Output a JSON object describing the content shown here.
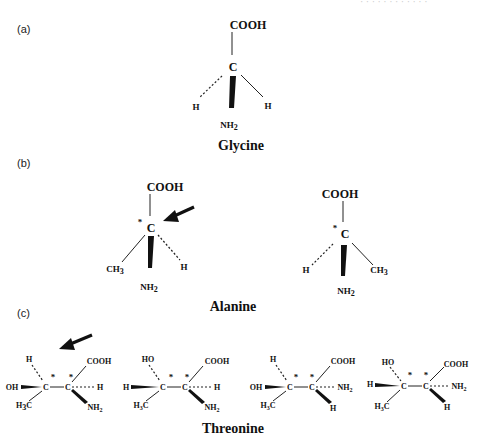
{
  "header_fragment": "· · · · · · · · · · · ·",
  "panels": {
    "a": {
      "label": "(a)",
      "name": "Glycine",
      "top": "COOH",
      "center": "C",
      "left": "H",
      "right": "H",
      "bottom": "NH",
      "bottom_sub": "2"
    },
    "b": {
      "label": "(b)",
      "name": "Alanine",
      "left_isomer": {
        "top": "COOH",
        "center": "C",
        "star": "*",
        "left": "CH",
        "left_sub": "3",
        "right": "H",
        "bottom": "NH",
        "bottom_sub": "2"
      },
      "right_isomer": {
        "top": "COOH",
        "center": "C",
        "star": "*",
        "left": "H",
        "right": "CH",
        "right_sub": "3",
        "bottom": "NH",
        "bottom_sub": "2"
      }
    },
    "c": {
      "label": "(c)",
      "name": "Threonine",
      "isomers": [
        {
          "c1_up": "H",
          "c1_wedge": "OH",
          "c1_down": "H",
          "c1_down_sub": "3",
          "c1_down_tail": "C",
          "c2_up": "COOH",
          "c2_dash": "H",
          "c2_wedge": "NH",
          "c2_wedge_sub": "2",
          "c1": "C",
          "c2": "C",
          "star": "*"
        },
        {
          "c1_up": "HO",
          "c1_wedge": "H",
          "c1_down": "H",
          "c1_down_sub": "3",
          "c1_down_tail": "C",
          "c2_up": "COOH",
          "c2_dash": "H",
          "c2_wedge": "NH",
          "c2_wedge_sub": "2",
          "c1": "C",
          "c2": "C",
          "star": "*"
        },
        {
          "c1_up": "H",
          "c1_wedge": "OH",
          "c1_down": "H",
          "c1_down_sub": "3",
          "c1_down_tail": "C",
          "c2_up": "COOH",
          "c2_dash": "NH",
          "c2_dash_sub": "2",
          "c2_wedge": "H",
          "c1": "C",
          "c2": "C",
          "star": "*"
        },
        {
          "c1_up": "HO",
          "c1_wedge": "H",
          "c1_down": "H",
          "c1_down_sub": "3",
          "c1_down_tail": "C",
          "c2_up": "COOH",
          "c2_dash": "NH",
          "c2_dash_sub": "2",
          "c2_wedge": "H",
          "c1": "C",
          "c2": "C",
          "star": "*"
        }
      ]
    }
  }
}
